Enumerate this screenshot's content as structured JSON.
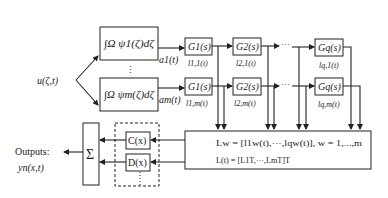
{
  "input": {
    "label": "u(ζ,t)"
  },
  "integrators": [
    {
      "label": "∫Ω ψ1(ζ)dζ",
      "output": "a1(t)"
    },
    {
      "label": "∫Ω ψm(ζ)dζ",
      "output": "am(t)"
    }
  ],
  "vdots": "⋮",
  "hdots": "···",
  "filter_rows": [
    {
      "blocks": [
        "G1(s)",
        "G2(s)",
        "Gq(s)"
      ],
      "outputs": [
        "l1,1(t)",
        "l2,1(t)",
        "lq,1(t)"
      ]
    },
    {
      "blocks": [
        "G1(s)",
        "G2(s)",
        "Gq(s)"
      ],
      "outputs": [
        "l1,m(t)",
        "l2,m(t)",
        "lq,m(t)"
      ]
    }
  ],
  "collector": {
    "line1": "Lw = [l1w(t),···,lqw(t)], w = 1,...,m",
    "line2": "L(t) = [L1T,···,LmT]T"
  },
  "output_maps": {
    "c_label": "C(x)",
    "d_label": "D(x)"
  },
  "sum": {
    "symbol": "Σ"
  },
  "outputs": {
    "title": "Outputs:",
    "signal": "yn(x,t)"
  }
}
